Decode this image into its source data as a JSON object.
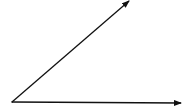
{
  "diagram": {
    "type": "angle",
    "stroke_color": "#111111",
    "vertex": {
      "x": 12,
      "y": 102
    },
    "rays": [
      {
        "name": "upper-ray",
        "end": {
          "x": 129,
          "y": 1
        },
        "arrowhead": true
      },
      {
        "name": "lower-ray",
        "end": {
          "x": 181,
          "y": 103
        },
        "arrowhead": true
      }
    ]
  }
}
